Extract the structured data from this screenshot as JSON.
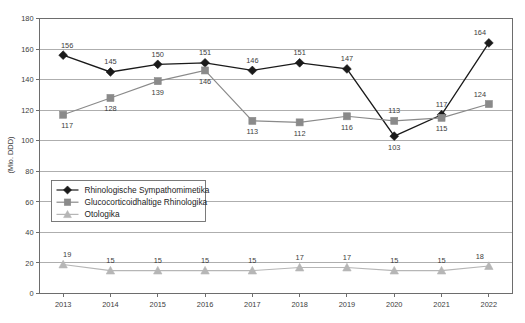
{
  "chart_data": {
    "type": "line",
    "title": "",
    "subtitle": "",
    "xlabel": "",
    "ylabel": "(Mio. DDD)",
    "categories": [
      "2013",
      "2014",
      "2015",
      "2016",
      "2017",
      "2018",
      "2019",
      "2020",
      "2021",
      "2022"
    ],
    "x": [
      2013,
      2014,
      2015,
      2016,
      2017,
      2018,
      2019,
      2020,
      2021,
      2022
    ],
    "ylim": [
      0,
      180
    ],
    "ytick_step": 20,
    "yticks": [
      "0",
      "20",
      "40",
      "60",
      "80",
      "100",
      "120",
      "140",
      "160",
      "180"
    ],
    "grid": "horizontal",
    "legend_position": "center-left",
    "series": [
      {
        "name": "Rhinologische Sympathomimetika",
        "marker": "diamond",
        "color": "#1a1a1a",
        "values": [
          156,
          145,
          150,
          151,
          146,
          151,
          147,
          103,
          117,
          164
        ],
        "label_positions": [
          "above",
          "above",
          "above",
          "above",
          "above",
          "above",
          "above",
          "below",
          "above",
          "above"
        ]
      },
      {
        "name": "Glucocorticoidhaltige Rhinologika",
        "marker": "square",
        "color": "#8a8a8a",
        "values": [
          117,
          128,
          139,
          146,
          113,
          112,
          116,
          113,
          115,
          124
        ],
        "label_positions": [
          "below",
          "below",
          "below",
          "below",
          "below",
          "below",
          "below",
          "above",
          "below",
          "above"
        ]
      },
      {
        "name": "Otologika",
        "marker": "triangle",
        "color": "#b6b6b6",
        "values": [
          19,
          15,
          15,
          15,
          15,
          17,
          17,
          15,
          15,
          18
        ],
        "label_positions": [
          "above",
          "above",
          "above",
          "above",
          "above",
          "above",
          "above",
          "above",
          "above",
          "above"
        ]
      }
    ]
  },
  "colors": {
    "series_1": "#1a1a1a",
    "series_2": "#8a8a8a",
    "series_3": "#b6b6b6",
    "axis": "#6d6d6d",
    "grid": "#9a9a9a",
    "text": "#3d3d3d",
    "background": "#ffffff"
  },
  "legend": {
    "items": [
      {
        "label": "Rhinologische Sympathomimetika",
        "marker": "diamond",
        "color": "#1a1a1a"
      },
      {
        "label": "Glucocorticoidhaltige Rhinologika",
        "marker": "square",
        "color": "#8a8a8a"
      },
      {
        "label": "Otologika",
        "marker": "triangle",
        "color": "#b6b6b6"
      }
    ]
  }
}
